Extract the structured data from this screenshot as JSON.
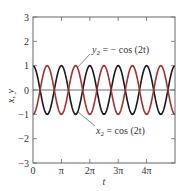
{
  "chart_data": {
    "type": "line",
    "title": "",
    "xlabel": "t",
    "ylabel": "x, y",
    "xlim": [
      0,
      5
    ],
    "xlim_units": "multiples of pi",
    "ylim": [
      -3,
      3
    ],
    "grid": false,
    "legend": "none (inline annotations with leader lines)",
    "x_ticks": [
      {
        "value": 0,
        "label": "0"
      },
      {
        "value": 1,
        "label": "π"
      },
      {
        "value": 2,
        "label": "2π"
      },
      {
        "value": 3,
        "label": "3π"
      },
      {
        "value": 4,
        "label": "4π"
      }
    ],
    "y_ticks": [
      {
        "value": 3,
        "label": "3"
      },
      {
        "value": 2,
        "label": "2"
      },
      {
        "value": 1,
        "label": "1"
      },
      {
        "value": 0,
        "label": "0"
      },
      {
        "value": -1,
        "label": "−1"
      },
      {
        "value": -2,
        "label": "−2"
      },
      {
        "value": -3,
        "label": "−3"
      }
    ],
    "series": [
      {
        "name": "x₂ = cos (2t)",
        "function": "cos(2t)",
        "color": "#1a1a1a",
        "amplitude": 1,
        "period_pi": 1
      },
      {
        "name": "y₂ = − cos (2t)",
        "function": "-cos(2t)",
        "color": "#a33235",
        "amplitude": 1,
        "period_pi": 1
      }
    ],
    "annotations": [
      {
        "text": "y₂ = − cos (2t)",
        "target_series": "y₂"
      },
      {
        "text": "x₂ = cos (2t)",
        "target_series": "x₂"
      }
    ],
    "zero_line": true
  },
  "labels": {
    "y_axis": "x, y",
    "x_axis": "t",
    "annot_y2_prefix": "y",
    "annot_y2_sub": "2",
    "annot_y2_rest": " = − cos (2t)",
    "annot_x2_prefix": "x",
    "annot_x2_sub": "2",
    "annot_x2_rest": " = cos (2t)"
  }
}
